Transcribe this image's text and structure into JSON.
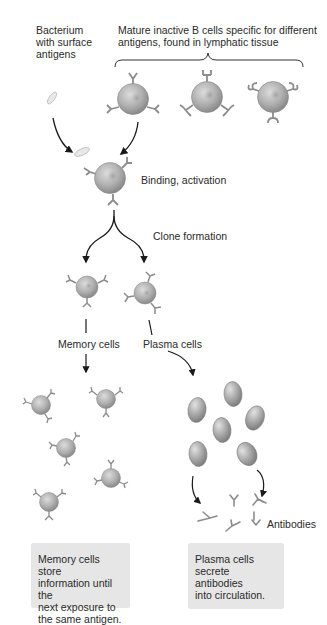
{
  "labels": {
    "bacterium": [
      "Bacterium",
      "with surface",
      "antigens"
    ],
    "mature_cells": [
      "Mature inactive B cells specific for different",
      "antigens, found in lymphatic tissue"
    ],
    "binding": "Binding, activation",
    "clone": "Clone formation",
    "memory": "Memory cells",
    "plasma": "Plasma cells",
    "antibodies": "Antibodies"
  },
  "notes": {
    "memory": [
      "Memory cells store",
      "information until the",
      "next exposure to",
      "the same antigen."
    ],
    "plasma": [
      "Plasma cells",
      "secrete antibodies",
      "into circulation."
    ]
  },
  "colors": {
    "cell_fill": "#a9a9a9",
    "cell_light": "#d8d8d8",
    "receptor": "#8c8c8c",
    "arrow": "#1a1a1a",
    "note_bg": "#e6e6e6"
  }
}
